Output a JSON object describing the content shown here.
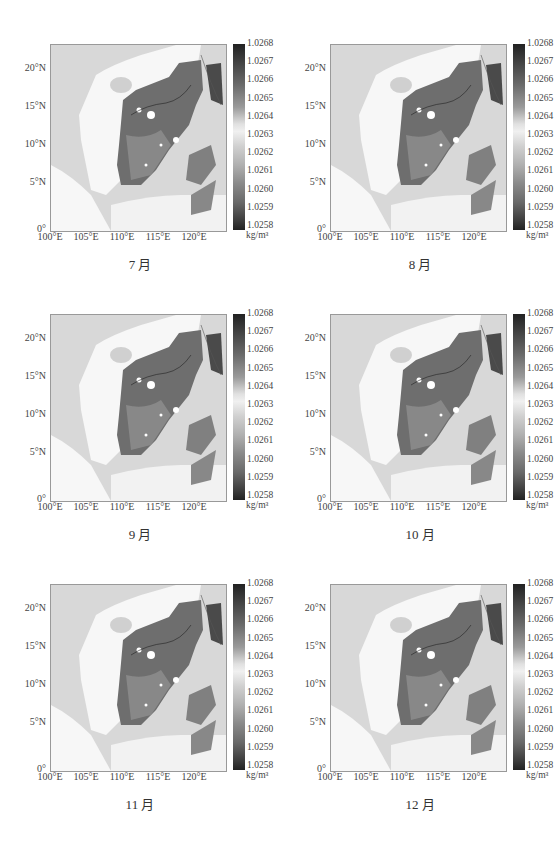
{
  "figure": {
    "colorbar": {
      "ticks": [
        "1.0268",
        "1.0267",
        "1.0266",
        "1.0265",
        "1.0264",
        "1.0263",
        "1.0262",
        "1.0261",
        "1.0260",
        "1.0259",
        "1.0258"
      ],
      "unit": "kg/m³"
    },
    "xticks": [
      "100°E",
      "105°E",
      "110°E",
      "115°E",
      "120°E"
    ],
    "yticks": [
      "20°N",
      "15°N",
      "10°N",
      "5°N",
      "0°"
    ],
    "panels": [
      {
        "title": "7 月",
        "contour_labels": [
          "1.0266",
          "1.0265",
          "1.0266"
        ]
      },
      {
        "title": "8 月",
        "contour_labels": [
          "1.0266"
        ]
      },
      {
        "title": "9 月",
        "contour_labels": []
      },
      {
        "title": "10 月",
        "contour_labels": [
          "1.0265",
          "1.0266",
          "1.0266",
          "1.0263",
          "1.0265"
        ]
      },
      {
        "title": "11 月",
        "contour_labels": [
          "1.0263",
          "1.0266"
        ]
      },
      {
        "title": "12 月",
        "contour_labels": [
          "1.0266"
        ]
      }
    ]
  },
  "chart_data": {
    "type": "heatmap",
    "xlabel": "Longitude",
    "ylabel": "Latitude",
    "xlim": [
      100,
      124
    ],
    "ylim": [
      0,
      24.5
    ],
    "colorbar_range": [
      1.0258,
      1.0268
    ],
    "colorbar_unit": "kg/m³",
    "panels": [
      "7 月",
      "8 月",
      "9 月",
      "10 月",
      "11 月",
      "12 月"
    ],
    "layout": "3 rows × 2 columns",
    "contours_visible": [
      {
        "panel": "7 月",
        "labels": [
          "1.0266",
          "1.0265"
        ]
      },
      {
        "panel": "8 月",
        "labels": [
          "1.0266"
        ]
      },
      {
        "panel": "10 月",
        "labels": [
          "1.0265",
          "1.0266",
          "1.0263"
        ]
      },
      {
        "panel": "11 月",
        "labels": [
          "1.0263",
          "1.0266"
        ]
      },
      {
        "panel": "12 月",
        "labels": [
          "1.0266"
        ]
      }
    ]
  }
}
